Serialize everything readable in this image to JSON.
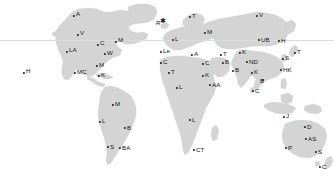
{
  "map": {
    "title": "World Map with City Markers",
    "projection": "equirectangular",
    "width": 334,
    "height": 184,
    "colors": {
      "background": "#ffffff",
      "land": "#d4d4d4",
      "land_stroke": "#c7c7c7",
      "marker": "#1a1a1a",
      "label": "#141414",
      "latitude_line": "#d8dde2"
    },
    "latitude_lines": [
      {
        "name": "upper-latitude-line",
        "y": 40
      }
    ]
  },
  "markers": [
    {
      "name": "marker-a-alaska",
      "label": "A",
      "x": 74,
      "y": 16,
      "lx": 76,
      "ly": 11,
      "star": false
    },
    {
      "name": "marker-v-vancouver",
      "label": "V",
      "x": 78,
      "y": 35,
      "lx": 80,
      "ly": 30,
      "star": false
    },
    {
      "name": "marker-la-losangeles",
      "label": "LA",
      "x": 67,
      "y": 52,
      "lx": 69,
      "ly": 47,
      "star": false
    },
    {
      "name": "marker-c-chicago",
      "label": "C",
      "x": 98,
      "y": 45,
      "lx": 100,
      "ly": 40,
      "star": false
    },
    {
      "name": "marker-m-montreal",
      "label": "M",
      "x": 116,
      "y": 42,
      "lx": 118,
      "ly": 37,
      "star": false
    },
    {
      "name": "marker-w-washington",
      "label": "W",
      "x": 105,
      "y": 54,
      "lx": 107,
      "ly": 50,
      "star": false
    },
    {
      "name": "marker-m-miami",
      "label": "M",
      "x": 97,
      "y": 66,
      "lx": 99,
      "ly": 62,
      "star": false
    },
    {
      "name": "marker-mc-mexicocity",
      "label": "MC",
      "x": 75,
      "y": 73,
      "lx": 77,
      "ly": 69,
      "star": false
    },
    {
      "name": "marker-k-kingston",
      "label": "K",
      "x": 99,
      "y": 76,
      "lx": 101,
      "ly": 72,
      "star": false
    },
    {
      "name": "marker-h-honolulu",
      "label": "H",
      "x": 24,
      "y": 73,
      "lx": 26,
      "ly": 68,
      "star": false
    },
    {
      "name": "marker-r-reykjavik",
      "label": "R",
      "x": 163,
      "y": 20,
      "lx": 156,
      "ly": 20,
      "star": true
    },
    {
      "name": "marker-t-tromso",
      "label": "T",
      "x": 190,
      "y": 17,
      "lx": 192,
      "ly": 13,
      "star": false
    },
    {
      "name": "marker-l-london",
      "label": "L",
      "x": 173,
      "y": 40,
      "lx": 175,
      "ly": 36,
      "star": false
    },
    {
      "name": "marker-m-moscow",
      "label": "M",
      "x": 205,
      "y": 33,
      "lx": 207,
      "ly": 29,
      "star": false
    },
    {
      "name": "marker-le-lisbon",
      "label": "Le",
      "x": 161,
      "y": 52,
      "lx": 163,
      "ly": 48,
      "star": false
    },
    {
      "name": "marker-c-casablanca",
      "label": "C",
      "x": 161,
      "y": 63,
      "lx": 163,
      "ly": 59,
      "star": false
    },
    {
      "name": "marker-a-athens",
      "label": "A",
      "x": 192,
      "y": 55,
      "lx": 194,
      "ly": 51,
      "star": false
    },
    {
      "name": "marker-c-cairo",
      "label": "C",
      "x": 203,
      "y": 64,
      "lx": 205,
      "ly": 60,
      "star": false
    },
    {
      "name": "marker-v-verkhoyansk",
      "label": "V",
      "x": 257,
      "y": 16,
      "lx": 259,
      "ly": 12,
      "star": false
    },
    {
      "name": "marker-ub-ulaanbaatar",
      "label": "UB",
      "x": 259,
      "y": 40,
      "lx": 261,
      "ly": 37,
      "star": false
    },
    {
      "name": "marker-h-harbin",
      "label": "H",
      "x": 279,
      "y": 41,
      "lx": 281,
      "ly": 38,
      "star": false
    },
    {
      "name": "marker-t-tehran",
      "label": "T",
      "x": 221,
      "y": 55,
      "lx": 223,
      "ly": 51,
      "star": false
    },
    {
      "name": "marker-k-kabul",
      "label": "K",
      "x": 240,
      "y": 53,
      "lx": 242,
      "ly": 49,
      "star": false
    },
    {
      "name": "marker-nd-newdelhi",
      "label": "ND",
      "x": 247,
      "y": 62,
      "lx": 249,
      "ly": 59,
      "star": false
    },
    {
      "name": "marker-b-bombay",
      "label": "B",
      "x": 233,
      "y": 71,
      "lx": 235,
      "ly": 67,
      "star": false
    },
    {
      "name": "marker-s-seoul",
      "label": "S",
      "x": 283,
      "y": 59,
      "lx": 285,
      "ly": 55,
      "star": false
    },
    {
      "name": "marker-t-tokyo",
      "label": "T",
      "x": 295,
      "y": 53,
      "lx": 297,
      "ly": 49,
      "star": false
    },
    {
      "name": "marker-k-kolkata",
      "label": "K",
      "x": 252,
      "y": 73,
      "lx": 254,
      "ly": 69,
      "star": false
    },
    {
      "name": "marker-hk-hongkong",
      "label": "HK",
      "x": 281,
      "y": 70,
      "lx": 283,
      "ly": 67,
      "star": false
    },
    {
      "name": "marker-b-bangkok",
      "label": "B",
      "x": 263,
      "y": 80,
      "lx": 260,
      "ly": 78,
      "star": false
    },
    {
      "name": "marker-c-colombo",
      "label": "C",
      "x": 253,
      "y": 91,
      "lx": 255,
      "ly": 88,
      "star": false
    },
    {
      "name": "marker-aa-addisababa",
      "label": "AA",
      "x": 210,
      "y": 85,
      "lx": 212,
      "ly": 82,
      "star": false
    },
    {
      "name": "marker-k-khartoum",
      "label": "K",
      "x": 203,
      "y": 76,
      "lx": 205,
      "ly": 72,
      "star": false
    },
    {
      "name": "marker-t-timbuktu",
      "label": "T",
      "x": 169,
      "y": 73,
      "lx": 171,
      "ly": 69,
      "star": false
    },
    {
      "name": "marker-l-lagos",
      "label": "L",
      "x": 177,
      "y": 88,
      "lx": 179,
      "ly": 84,
      "star": false
    },
    {
      "name": "marker-b-baghdad",
      "label": "B",
      "x": 223,
      "y": 63,
      "lx": 225,
      "ly": 59,
      "star": false
    },
    {
      "name": "marker-l-luanda",
      "label": "L",
      "x": 190,
      "y": 120,
      "lx": 192,
      "ly": 117,
      "star": false
    },
    {
      "name": "marker-ct-capetown",
      "label": "CT",
      "x": 194,
      "y": 150,
      "lx": 196,
      "ly": 147,
      "star": false
    },
    {
      "name": "marker-m-manaus",
      "label": "M",
      "x": 113,
      "y": 105,
      "lx": 115,
      "ly": 101,
      "star": false
    },
    {
      "name": "marker-l-lima",
      "label": "L",
      "x": 100,
      "y": 122,
      "lx": 102,
      "ly": 118,
      "star": false
    },
    {
      "name": "marker-b-brasilia",
      "label": "B",
      "x": 125,
      "y": 128,
      "lx": 127,
      "ly": 125,
      "star": false
    },
    {
      "name": "marker-s-santiago",
      "label": "S",
      "x": 108,
      "y": 147,
      "lx": 110,
      "ly": 144,
      "star": false
    },
    {
      "name": "marker-ba-buenosaires",
      "label": "BA",
      "x": 120,
      "y": 148,
      "lx": 122,
      "ly": 145,
      "star": false
    },
    {
      "name": "marker-j-jakarta",
      "label": "J",
      "x": 284,
      "y": 117,
      "lx": 286,
      "ly": 113,
      "star": false
    },
    {
      "name": "marker-d-darwin",
      "label": "D",
      "x": 305,
      "y": 127,
      "lx": 307,
      "ly": 124,
      "star": false
    },
    {
      "name": "marker-as-alicesprings",
      "label": "AS",
      "x": 306,
      "y": 139,
      "lx": 308,
      "ly": 136,
      "star": false
    },
    {
      "name": "marker-p-perth",
      "label": "P",
      "x": 286,
      "y": 148,
      "lx": 288,
      "ly": 145,
      "star": false
    },
    {
      "name": "marker-s-sydney",
      "label": "S",
      "x": 316,
      "y": 152,
      "lx": 318,
      "ly": 149,
      "star": false
    },
    {
      "name": "marker-c-christchurch",
      "label": "C",
      "x": 320,
      "y": 167,
      "lx": 322,
      "ly": 164,
      "star": false
    }
  ]
}
